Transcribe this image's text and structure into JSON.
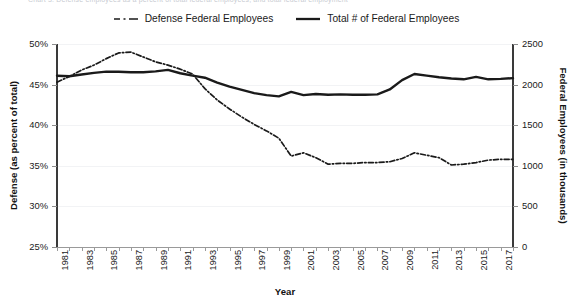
{
  "top_caption_fragment": "Chart 3: Defense employees as a percent of total federal employees, and total federal employment",
  "legend": {
    "position": "top-center",
    "items": [
      {
        "label": "Defense Federal Employees",
        "style": "dash-dot",
        "color": "#1a1a1a",
        "axis": "left"
      },
      {
        "label": "Total # of Federal Employees",
        "style": "solid",
        "color": "#1a1a1a",
        "axis": "right"
      }
    ]
  },
  "chart_data": {
    "type": "line",
    "title": "",
    "xlabel": "Year",
    "ylabel": "Defense (as percent of total)",
    "y2label": "Federal Employees (in thousands)",
    "grid": true,
    "legend_position": "top-center",
    "xlim": [
      1981,
      2018
    ],
    "ylim": [
      25,
      50
    ],
    "y2lim": [
      0,
      2500
    ],
    "ytick_labels": [
      "25%",
      "30%",
      "35%",
      "40%",
      "45%",
      "50%"
    ],
    "ytick_values": [
      25,
      30,
      35,
      40,
      45,
      50
    ],
    "y2tick_labels": [
      "0",
      "500",
      "1000",
      "1500",
      "2000",
      "2500"
    ],
    "y2tick_values": [
      0,
      500,
      1000,
      1500,
      2000,
      2500
    ],
    "x": [
      1981,
      1982,
      1983,
      1984,
      1985,
      1986,
      1987,
      1988,
      1989,
      1990,
      1991,
      1992,
      1993,
      1994,
      1995,
      1996,
      1997,
      1998,
      1999,
      2000,
      2001,
      2002,
      2003,
      2004,
      2005,
      2006,
      2007,
      2008,
      2009,
      2010,
      2011,
      2012,
      2013,
      2014,
      2015,
      2016,
      2017,
      2018
    ],
    "xtick_labels": [
      "1981",
      "1983",
      "1985",
      "1987",
      "1989",
      "1991",
      "1993",
      "1995",
      "1997",
      "1999",
      "2001",
      "2003",
      "2005",
      "2007",
      "2009",
      "2011",
      "2013",
      "2015",
      "2017"
    ],
    "xtick_values": [
      1981,
      1983,
      1985,
      1987,
      1989,
      1991,
      1993,
      1995,
      1997,
      1999,
      2001,
      2003,
      2005,
      2007,
      2009,
      2011,
      2013,
      2015,
      2017
    ],
    "series": [
      {
        "name": "Defense Federal Employees",
        "axis": "left",
        "unit": "percent of total",
        "style": "dash-dot",
        "values": [
          45.3,
          46.0,
          46.8,
          47.4,
          48.2,
          48.9,
          49.0,
          48.4,
          47.8,
          47.4,
          46.9,
          46.3,
          44.5,
          43.1,
          42.0,
          41.0,
          40.1,
          39.3,
          38.4,
          36.2,
          36.6,
          36.0,
          35.2,
          35.3,
          35.3,
          35.4,
          35.4,
          35.5,
          35.9,
          36.6,
          36.3,
          36.0,
          35.1,
          35.2,
          35.4,
          35.7,
          35.8,
          35.8
        ]
      },
      {
        "name": "Total # of Federal Employees",
        "axis": "right",
        "unit": "thousands",
        "style": "solid",
        "values": [
          2109,
          2103,
          2125,
          2145,
          2160,
          2158,
          2153,
          2153,
          2163,
          2181,
          2140,
          2110,
          2085,
          2025,
          1975,
          1935,
          1895,
          1870,
          1855,
          1910,
          1870,
          1885,
          1875,
          1880,
          1875,
          1875,
          1880,
          1940,
          2055,
          2130,
          2110,
          2090,
          2075,
          2065,
          2095,
          2065,
          2070,
          2080
        ]
      }
    ]
  },
  "axes": {
    "left_title": "Defense (as percent of total)",
    "right_title": "Federal Employees (in thousands)",
    "x_title": "Year"
  }
}
